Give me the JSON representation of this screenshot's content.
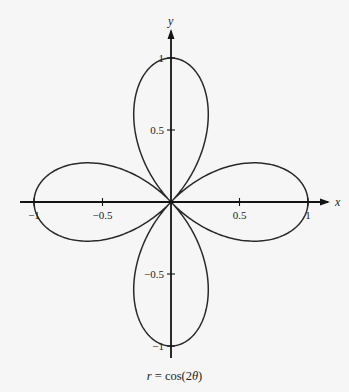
{
  "chart_data": {
    "type": "line",
    "subtype": "polar-curve",
    "title": "",
    "caption": "r = cos(2θ)",
    "equation": {
      "lhs": "r",
      "rhs": "cos(2θ)"
    },
    "xlabel": "x",
    "ylabel": "y",
    "xlim": [
      -1,
      1
    ],
    "ylim": [
      -1,
      1
    ],
    "grid": false,
    "legend": null,
    "x_ticks": [
      {
        "value": -1,
        "label": "−1"
      },
      {
        "value": -0.5,
        "label": "−0.5"
      },
      {
        "value": 0.5,
        "label": "0.5"
      },
      {
        "value": 1,
        "label": "1"
      }
    ],
    "y_ticks": [
      {
        "value": 1,
        "label": "1"
      },
      {
        "value": 0.5,
        "label": "0.5"
      },
      {
        "value": -0.5,
        "label": "−0.5"
      },
      {
        "value": -1,
        "label": "−1"
      }
    ],
    "series": [
      {
        "name": "r = cos(2θ)",
        "description": "four-petal rose",
        "theta_range": [
          0,
          6.283185
        ],
        "petal_tips": [
          [
            1,
            0
          ],
          [
            0,
            1
          ],
          [
            -1,
            0
          ],
          [
            0,
            -1
          ]
        ],
        "sample_points": [
          {
            "theta_deg": 0,
            "r": 1.0,
            "x": 1.0,
            "y": 0.0
          },
          {
            "theta_deg": 15,
            "r": 0.866,
            "x": 0.837,
            "y": 0.224
          },
          {
            "theta_deg": 30,
            "r": 0.5,
            "x": 0.433,
            "y": 0.25
          },
          {
            "theta_deg": 45,
            "r": 0.0,
            "x": 0.0,
            "y": 0.0
          },
          {
            "theta_deg": 60,
            "r": -0.5,
            "x": -0.25,
            "y": -0.433
          },
          {
            "theta_deg": 75,
            "r": -0.866,
            "x": -0.224,
            "y": -0.837
          },
          {
            "theta_deg": 90,
            "r": -1.0,
            "x": 0.0,
            "y": -1.0
          },
          {
            "theta_deg": 135,
            "r": 0.0,
            "x": 0.0,
            "y": 0.0
          },
          {
            "theta_deg": 180,
            "r": 1.0,
            "x": -1.0,
            "y": 0.0
          },
          {
            "theta_deg": 270,
            "r": -1.0,
            "x": 0.0,
            "y": 1.0
          }
        ]
      }
    ]
  },
  "labels": {
    "x_axis": "x",
    "y_axis": "y",
    "caption_lhs": "r",
    "caption_eq": " = cos(2",
    "caption_theta": "θ",
    "caption_close": ")"
  },
  "colors": {
    "background": "#f6f6f6",
    "axes": "#141414",
    "curve": "#2a2a2a"
  }
}
